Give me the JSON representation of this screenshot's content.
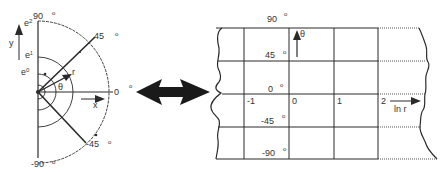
{
  "left_diagram": {
    "title": "polar plane",
    "angle_labels": [
      {
        "text": "90",
        "deg": "o"
      },
      {
        "text": "45",
        "deg": "o"
      },
      {
        "text": "0",
        "deg": "o"
      },
      {
        "text": "-45",
        "deg": "o"
      },
      {
        "text": "-90",
        "deg": "o"
      }
    ],
    "radius_labels": [
      "e2",
      "e1",
      "e0"
    ],
    "axis_y": "y",
    "axis_x": "x",
    "vector_r": "r",
    "angle_theta": "θ"
  },
  "connector": {
    "type": "double-arrow"
  },
  "right_diagram": {
    "title": "log-polar plane",
    "row_labels": [
      {
        "text": "90",
        "deg": "o"
      },
      {
        "text": "45",
        "deg": "o"
      },
      {
        "text": "0",
        "deg": "o"
      },
      {
        "text": "-45",
        "deg": "o"
      },
      {
        "text": "-90",
        "deg": "o"
      }
    ],
    "col_labels": [
      "-1",
      "0",
      "1",
      "2"
    ],
    "axis_theta": "θ",
    "axis_lnr": "ln r"
  },
  "colors": {
    "line": "#2a2a2a",
    "text": "#333333",
    "background": "#ffffff"
  }
}
